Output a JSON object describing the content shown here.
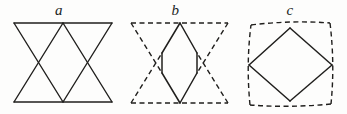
{
  "document": {
    "kind": "geometry-figure-plate",
    "background_color": "#fdfdfc",
    "ink_color": "#201f1d",
    "caption_style": "italic-serif-lowercase"
  },
  "figures": [
    {
      "id": "a",
      "label": "a",
      "description": "Two overlapping solid triangles inscribed in a rectangle forming an hourglass star",
      "line_style": "solid",
      "stroke_color": "#201f1d",
      "stroke_width": 1.4,
      "frame": {
        "left": 14,
        "top": 5,
        "right": 112,
        "bottom": 84
      },
      "polylines": [
        {
          "name": "top-edge",
          "style": "solid",
          "points": "14,5 112,5"
        },
        {
          "name": "bottom-edge",
          "style": "solid",
          "points": "14,84 112,84"
        },
        {
          "name": "left-side-up",
          "style": "solid",
          "points": "14,5 63,84"
        },
        {
          "name": "right-side-up",
          "style": "solid",
          "points": "112,5 63,84"
        },
        {
          "name": "left-side-down",
          "style": "solid",
          "points": "14,84 63,5"
        },
        {
          "name": "right-side-down",
          "style": "solid",
          "points": "112,84 63,5"
        }
      ]
    },
    {
      "id": "b",
      "label": "b",
      "description": "Two overlapping dashed triangles with the shared central rhombus drawn solid",
      "line_style": "mixed",
      "stroke_color": "#201f1d",
      "stroke_width": 1.4,
      "dash_pattern": "5,3.5",
      "frame": {
        "left": 13,
        "top": 5,
        "right": 110,
        "bottom": 85
      },
      "polylines": [
        {
          "name": "top-edge",
          "style": "dashed",
          "points": "13,5 110,5"
        },
        {
          "name": "bottom-edge",
          "style": "dashed",
          "points": "13,85 110,85"
        },
        {
          "name": "upper-tri-left",
          "style": "dashed",
          "points": "13,5 44,55"
        },
        {
          "name": "upper-tri-right",
          "style": "dashed",
          "points": "110,5 79,55"
        },
        {
          "name": "lower-tri-left",
          "style": "dashed",
          "points": "13,85 44,35"
        },
        {
          "name": "lower-tri-right",
          "style": "dashed",
          "points": "110,85 79,35"
        },
        {
          "name": "rhombus-upper-left",
          "style": "solid",
          "points": "62,5 44,35"
        },
        {
          "name": "rhombus-upper-right",
          "style": "solid",
          "points": "62,5 79,35"
        },
        {
          "name": "rhombus-lower-left",
          "style": "solid",
          "points": "62,85 44,55"
        },
        {
          "name": "rhombus-lower-right",
          "style": "solid",
          "points": "62,85 79,55"
        },
        {
          "name": "rhombus-left-side",
          "style": "solid",
          "points": "44,35 44,55"
        },
        {
          "name": "rhombus-right-side",
          "style": "solid",
          "points": "79,35 79,55"
        }
      ]
    },
    {
      "id": "c",
      "label": "c",
      "description": "Dashed quadrilateral with slightly bowed sides containing an inscribed solid diamond",
      "line_style": "mixed",
      "stroke_color": "#201f1d",
      "stroke_width": 1.4,
      "dash_pattern": "5,3.5",
      "frame": {
        "left": 16,
        "top": 5,
        "right": 98,
        "bottom": 86
      },
      "curves": [
        {
          "name": "quad-top-edge",
          "style": "dashed",
          "path": "M18,7 Q58,2 97,5"
        },
        {
          "name": "quad-right-edge",
          "style": "dashed",
          "path": "M97,5 Q102,46 98,86"
        },
        {
          "name": "quad-bottom-edge",
          "style": "dashed",
          "path": "M98,86 Q57,90 17,87"
        },
        {
          "name": "quad-left-edge",
          "style": "dashed",
          "path": "M17,87 Q13,46 18,7"
        }
      ],
      "polylines": [
        {
          "name": "diamond-top-left",
          "style": "solid",
          "points": "57,10 16,47"
        },
        {
          "name": "diamond-top-right",
          "style": "solid",
          "points": "57,10 99,47"
        },
        {
          "name": "diamond-bottom-left",
          "style": "solid",
          "points": "57,83 16,47"
        },
        {
          "name": "diamond-bottom-right",
          "style": "solid",
          "points": "57,83 99,47"
        }
      ]
    }
  ]
}
